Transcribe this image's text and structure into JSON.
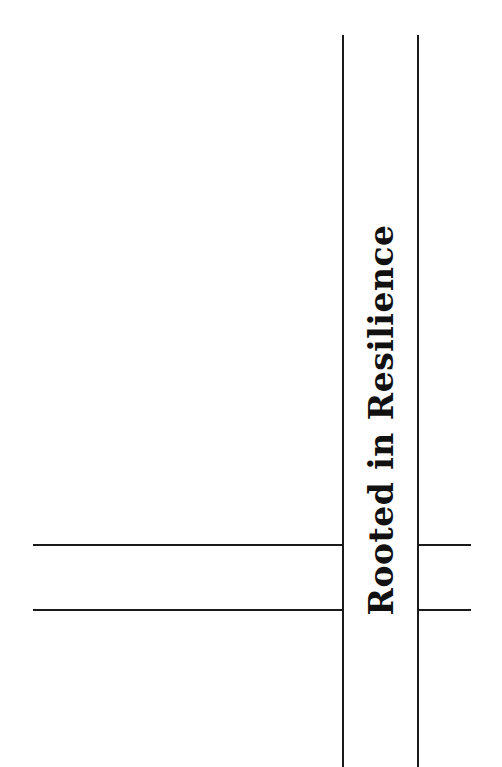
{
  "title_text": "Rooted in Resilience",
  "colors": {
    "background": "#ffffff",
    "lines": "#1a1a1a",
    "text": "#111111"
  },
  "layout": {
    "vertical_band": {
      "left_x": 343,
      "right_x": 418,
      "top_y": 35
    },
    "horizontal_lines": [
      {
        "y": 545,
        "left_segment": [
          33,
          343
        ],
        "right_segment": [
          418,
          471
        ]
      },
      {
        "y": 610,
        "left_segment": [
          33,
          343
        ],
        "right_segment": [
          418,
          471
        ]
      }
    ],
    "text_orientation": "vertical, reading bottom-to-top"
  }
}
